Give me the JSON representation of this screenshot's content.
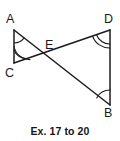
{
  "figure": {
    "caption": "Ex. 17 to 20",
    "stroke_color": "#1c1c1c",
    "background_color": "#ffffff",
    "vertices": [
      {
        "id": "A",
        "label": "A",
        "x": 14,
        "y": 30,
        "angle_marks": 1
      },
      {
        "id": "C",
        "label": "C",
        "x": 14,
        "y": 63,
        "angle_marks": 2
      },
      {
        "id": "E",
        "label": "E",
        "x": 50,
        "y": 57,
        "angle_marks": 0
      },
      {
        "id": "D",
        "label": "D",
        "x": 110,
        "y": 30,
        "angle_marks": 2
      },
      {
        "id": "B",
        "label": "B",
        "x": 110,
        "y": 105,
        "angle_marks": 1
      }
    ],
    "segments": [
      {
        "from": "A",
        "to": "C"
      },
      {
        "from": "A",
        "to": "B"
      },
      {
        "from": "C",
        "to": "D"
      },
      {
        "from": "D",
        "to": "B"
      }
    ],
    "labels": {
      "A": "A",
      "B": "B",
      "C": "C",
      "D": "D",
      "E": "E"
    }
  }
}
